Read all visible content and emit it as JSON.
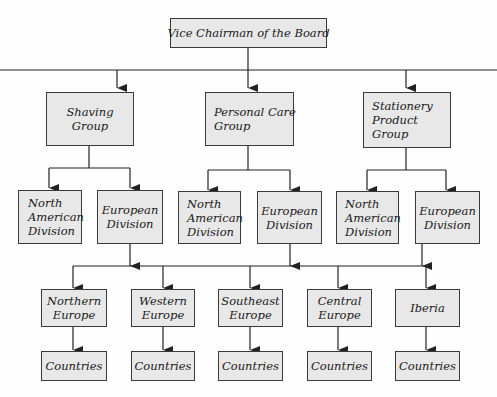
{
  "chart": {
    "title": "Vice Chairman of the Board",
    "groups": [
      {
        "label": [
          "Shaving",
          "Group"
        ],
        "divisions": [
          [
            "North",
            "American",
            "Division"
          ],
          [
            "European",
            "Division"
          ]
        ]
      },
      {
        "label": [
          "Personal Care",
          "Group"
        ],
        "divisions": [
          [
            "North",
            "American",
            "Division"
          ],
          [
            "European",
            "Division"
          ]
        ]
      },
      {
        "label": [
          "Stationery",
          "Product",
          "Group"
        ],
        "divisions": [
          [
            "North",
            "American",
            "Division"
          ],
          [
            "European",
            "Division"
          ]
        ]
      }
    ],
    "regions": [
      {
        "label": [
          "Northern",
          "Europe"
        ],
        "child": "Countries"
      },
      {
        "label": [
          "Western",
          "Europe"
        ],
        "child": "Countries"
      },
      {
        "label": [
          "Southeast",
          "Europe"
        ],
        "child": "Countries"
      },
      {
        "label": [
          "Central",
          "Europe"
        ],
        "child": "Countries"
      },
      {
        "label": [
          "Iberia"
        ],
        "child": "Countries"
      }
    ]
  },
  "colors": {
    "box_fill": "#e8e8e8",
    "box_border": "#3a3a3a",
    "line": "#222222"
  }
}
